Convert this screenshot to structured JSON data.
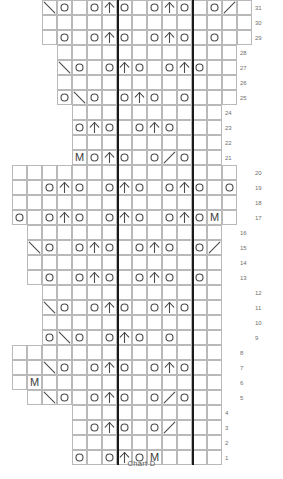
{
  "chart_data": {
    "type": "table",
    "title": "Chart D",
    "grid": {
      "cell_size": 15,
      "origin_x": 12,
      "origin_y": 12,
      "total_columns": 15,
      "total_rows": 32,
      "grid_line_color": "#b9b9b9",
      "symbol_color": "#4a4a4a",
      "repeat_line_color": "#1a1a1a",
      "grid_on": true
    },
    "legend": {
      "o": "yarn-over",
      "up": "centred-double-decrease",
      "left": "left-leaning-decrease",
      "right": "right-leaning-decrease",
      "M": "make-one"
    },
    "repeat_lines_x": [
      117,
      192
    ],
    "row_numbers": [
      1,
      2,
      3,
      4,
      5,
      6,
      7,
      8,
      9,
      10,
      11,
      12,
      13,
      14,
      15,
      16,
      17,
      18,
      19,
      20,
      21,
      22,
      23,
      24,
      25,
      26,
      27,
      28,
      29,
      30,
      31,
      32
    ],
    "rows": [
      {
        "num": 32,
        "y": 12,
        "x": 42,
        "cols": 14,
        "label_x": 255,
        "symbols": []
      },
      {
        "num": 31,
        "y": 27,
        "x": 42,
        "cols": 14,
        "label_x": 255,
        "symbols": [
          [
            0,
            "left"
          ],
          [
            1,
            "o"
          ],
          [
            3,
            "o"
          ],
          [
            4,
            "up"
          ],
          [
            5,
            "o"
          ],
          [
            7,
            "o"
          ],
          [
            8,
            "up"
          ],
          [
            9,
            "o"
          ],
          [
            11,
            "o"
          ],
          [
            12,
            "right"
          ]
        ]
      },
      {
        "num": 30,
        "y": 42,
        "x": 42,
        "cols": 14,
        "label_x": 255,
        "symbols": []
      },
      {
        "num": 29,
        "y": 57,
        "x": 42,
        "cols": 14,
        "label_x": 255,
        "symbols": [
          [
            1,
            "o"
          ],
          [
            3,
            "o"
          ],
          [
            4,
            "up"
          ],
          [
            5,
            "o"
          ],
          [
            7,
            "o"
          ],
          [
            8,
            "up"
          ],
          [
            9,
            "o"
          ],
          [
            11,
            "o"
          ]
        ]
      },
      {
        "num": 28,
        "y": 72,
        "x": 57,
        "cols": 12,
        "label_x": 240,
        "symbols": []
      },
      {
        "num": 27,
        "y": 87,
        "x": 57,
        "cols": 12,
        "label_x": 240,
        "symbols": [
          [
            0,
            "left"
          ],
          [
            1,
            "o"
          ],
          [
            3,
            "o"
          ],
          [
            4,
            "up"
          ],
          [
            5,
            "o"
          ],
          [
            7,
            "o"
          ],
          [
            8,
            "up"
          ],
          [
            9,
            "o"
          ]
        ]
      },
      {
        "num": 26,
        "y": 102,
        "x": 57,
        "cols": 12,
        "label_x": 240,
        "symbols": []
      },
      {
        "num": 25,
        "y": 117,
        "x": 57,
        "cols": 12,
        "label_x": 240,
        "symbols": [
          [
            0,
            "o"
          ],
          [
            1,
            "left"
          ],
          [
            2,
            "o"
          ],
          [
            4,
            "o"
          ],
          [
            5,
            "up"
          ],
          [
            6,
            "o"
          ],
          [
            8,
            "o"
          ]
        ]
      },
      {
        "num": 24,
        "y": 132,
        "x": 72,
        "cols": 10,
        "label_x": 225,
        "symbols": []
      },
      {
        "num": 23,
        "y": 147,
        "x": 72,
        "cols": 10,
        "label_x": 225,
        "symbols": [
          [
            0,
            "o"
          ],
          [
            1,
            "up"
          ],
          [
            2,
            "o"
          ],
          [
            4,
            "o"
          ],
          [
            5,
            "up"
          ],
          [
            6,
            "o"
          ]
        ]
      },
      {
        "num": 22,
        "y": 162,
        "x": 72,
        "cols": 10,
        "label_x": 225,
        "symbols": []
      },
      {
        "num": 21,
        "y": 177,
        "x": 72,
        "cols": 10,
        "label_x": 225,
        "symbols": [
          [
            0,
            "M"
          ],
          [
            1,
            "o"
          ],
          [
            2,
            "up"
          ],
          [
            3,
            "o"
          ],
          [
            5,
            "o"
          ],
          [
            6,
            "right"
          ],
          [
            7,
            "o"
          ]
        ]
      },
      {
        "num": 20,
        "y": 192,
        "x": 12,
        "cols": 15,
        "label_x": 255,
        "symbols": []
      },
      {
        "num": 19,
        "y": 207,
        "x": 12,
        "cols": 15,
        "label_x": 255,
        "symbols": [
          [
            2,
            "o"
          ],
          [
            3,
            "up"
          ],
          [
            4,
            "o"
          ],
          [
            6,
            "o"
          ],
          [
            7,
            "up"
          ],
          [
            8,
            "o"
          ],
          [
            10,
            "o"
          ],
          [
            11,
            "up"
          ],
          [
            12,
            "o"
          ],
          [
            14,
            "o"
          ]
        ]
      },
      {
        "num": 18,
        "y": 222,
        "x": 12,
        "cols": 15,
        "label_x": 255,
        "symbols": []
      },
      {
        "num": 17,
        "y": 237,
        "x": 12,
        "cols": 15,
        "label_x": 255,
        "symbols": [
          [
            0,
            "o"
          ],
          [
            2,
            "o"
          ],
          [
            3,
            "up"
          ],
          [
            4,
            "o"
          ],
          [
            6,
            "o"
          ],
          [
            7,
            "up"
          ],
          [
            8,
            "o"
          ],
          [
            10,
            "o"
          ],
          [
            11,
            "up"
          ],
          [
            12,
            "o"
          ],
          [
            13,
            "M"
          ]
        ]
      },
      {
        "num": 16,
        "y": 252,
        "x": 27,
        "cols": 13,
        "label_x": 240,
        "symbols": []
      },
      {
        "num": 15,
        "y": 267,
        "x": 27,
        "cols": 13,
        "label_x": 240,
        "symbols": [
          [
            0,
            "left"
          ],
          [
            1,
            "o"
          ],
          [
            3,
            "o"
          ],
          [
            4,
            "up"
          ],
          [
            5,
            "o"
          ],
          [
            7,
            "o"
          ],
          [
            8,
            "up"
          ],
          [
            9,
            "o"
          ],
          [
            11,
            "o"
          ],
          [
            12,
            "right"
          ]
        ]
      },
      {
        "num": 14,
        "y": 282,
        "x": 27,
        "cols": 13,
        "label_x": 240,
        "symbols": []
      },
      {
        "num": 13,
        "y": 297,
        "x": 27,
        "cols": 13,
        "label_x": 240,
        "symbols": [
          [
            1,
            "o"
          ],
          [
            3,
            "o"
          ],
          [
            4,
            "up"
          ],
          [
            5,
            "o"
          ],
          [
            7,
            "o"
          ],
          [
            8,
            "up"
          ],
          [
            9,
            "o"
          ],
          [
            11,
            "o"
          ]
        ]
      },
      {
        "num": 12,
        "y": 312,
        "x": 42,
        "cols": 12,
        "label_x": 255,
        "symbols": []
      },
      {
        "num": 11,
        "y": 327,
        "x": 42,
        "cols": 12,
        "label_x": 255,
        "symbols": [
          [
            0,
            "left"
          ],
          [
            1,
            "o"
          ],
          [
            3,
            "o"
          ],
          [
            4,
            "up"
          ],
          [
            5,
            "o"
          ],
          [
            7,
            "o"
          ],
          [
            8,
            "up"
          ],
          [
            9,
            "o"
          ]
        ]
      },
      {
        "num": 10,
        "y": 342,
        "x": 42,
        "cols": 12,
        "label_x": 255,
        "symbols": []
      },
      {
        "num": 9,
        "y": 357,
        "x": 42,
        "cols": 12,
        "label_x": 255,
        "symbols": [
          [
            0,
            "o"
          ],
          [
            1,
            "left"
          ],
          [
            2,
            "o"
          ],
          [
            4,
            "o"
          ],
          [
            5,
            "up"
          ],
          [
            6,
            "o"
          ],
          [
            8,
            "o"
          ]
        ]
      },
      {
        "num": 8,
        "y": 372,
        "x": 12,
        "cols": 14,
        "label_x": 240,
        "symbols": []
      },
      {
        "num": 7,
        "y": 387,
        "x": 12,
        "cols": 14,
        "label_x": 240,
        "symbols": [
          [
            2,
            "left"
          ],
          [
            3,
            "o"
          ],
          [
            5,
            "o"
          ],
          [
            6,
            "up"
          ],
          [
            7,
            "o"
          ],
          [
            9,
            "o"
          ],
          [
            10,
            "up"
          ],
          [
            11,
            "o"
          ]
        ]
      },
      {
        "num": 6,
        "y": 402,
        "x": 12,
        "cols": 14,
        "label_x": 240,
        "symbols": [
          [
            1,
            "M"
          ]
        ]
      },
      {
        "num": 5,
        "y": 417,
        "x": 27,
        "cols": 13,
        "label_x": 240,
        "symbols": [
          [
            1,
            "left"
          ],
          [
            2,
            "o"
          ],
          [
            4,
            "o"
          ],
          [
            5,
            "up"
          ],
          [
            6,
            "o"
          ],
          [
            8,
            "o"
          ],
          [
            9,
            "right"
          ],
          [
            10,
            "o"
          ]
        ]
      },
      {
        "num": 4,
        "y": 432,
        "x": 72,
        "cols": 10,
        "label_x": 225,
        "symbols": []
      },
      {
        "num": 3,
        "y": 447,
        "x": 72,
        "cols": 10,
        "label_x": 225,
        "symbols": [
          [
            1,
            "o"
          ],
          [
            2,
            "up"
          ],
          [
            3,
            "o"
          ],
          [
            5,
            "o"
          ],
          [
            6,
            "right"
          ]
        ]
      },
      {
        "num": 2,
        "y": 462,
        "x": 72,
        "cols": 10,
        "label_x": 225,
        "symbols": []
      },
      {
        "num": 1,
        "y": 477,
        "x": 72,
        "cols": 10,
        "label_x": 225,
        "symbols": [
          [
            0,
            "o"
          ],
          [
            2,
            "o"
          ],
          [
            3,
            "up"
          ],
          [
            4,
            "o"
          ],
          [
            5,
            "M"
          ]
        ]
      }
    ]
  },
  "caption": {
    "text": "Chart D"
  }
}
